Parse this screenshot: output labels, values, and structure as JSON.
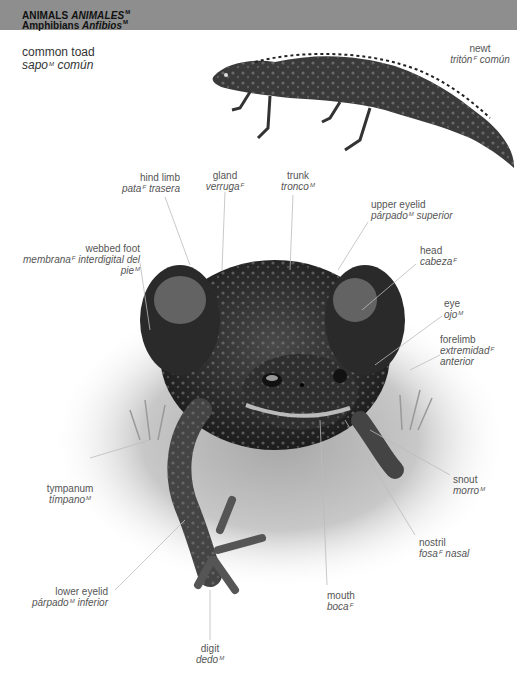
{
  "header": {
    "section_en": "ANIMALS",
    "section_es": "ANIMALES",
    "section_gender": "M",
    "subsection_en": "Amphibians",
    "subsection_es": "Anfibios",
    "subsection_gender": "M",
    "bg_color": "#8e8e8e"
  },
  "main_title": {
    "en": "common toad",
    "es_a": "sapo",
    "gender": "M",
    "es_b": "común"
  },
  "newt": {
    "en": "newt",
    "es_a": "tritón",
    "gender": "F",
    "es_b": "común"
  },
  "labels": {
    "hind_limb": {
      "en": "hind limb",
      "es_a": "pata",
      "gender": "F",
      "es_b": "trasera"
    },
    "gland": {
      "en": "gland",
      "es_a": "verruga",
      "gender": "F"
    },
    "trunk": {
      "en": "trunk",
      "es_a": "tronco",
      "gender": "M"
    },
    "upper_eyelid": {
      "en": "upper eyelid",
      "es_a": "párpado",
      "gender": "M",
      "es_b": "superior"
    },
    "webbed_foot": {
      "en": "webbed foot",
      "es_a": "membrana",
      "gender": "F",
      "es_b": "interdigital del pie",
      "gender2": "M"
    },
    "head": {
      "en": "head",
      "es_a": "cabeza",
      "gender": "F"
    },
    "eye": {
      "en": "eye",
      "es_a": "ojo",
      "gender": "M"
    },
    "forelimb": {
      "en": "forelimb",
      "es_a": "extremidad",
      "gender": "F",
      "es_b": "anterior"
    },
    "tympanum": {
      "en": "tympanum",
      "es_a": "tímpano",
      "gender": "M"
    },
    "snout": {
      "en": "snout",
      "es_a": "morro",
      "gender": "M"
    },
    "nostril": {
      "en": "nostril",
      "es_a": "fosa",
      "gender": "F",
      "es_b": "nasal"
    },
    "lower_eyelid": {
      "en": "lower eyelid",
      "es_a": "párpado",
      "gender": "M",
      "es_b": "inferior"
    },
    "mouth": {
      "en": "mouth",
      "es_a": "boca",
      "gender": "F"
    },
    "digit": {
      "en": "digit",
      "es_a": "dedo",
      "gender": "M"
    }
  }
}
